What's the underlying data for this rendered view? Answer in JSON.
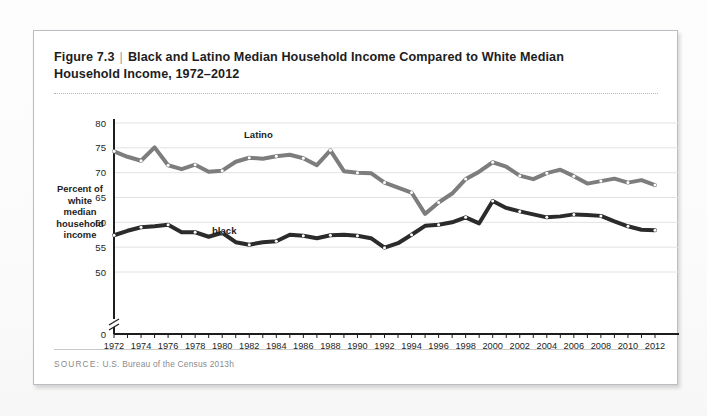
{
  "figure": {
    "number": "Figure 7.3",
    "separator": "|",
    "title_line1": "Black and Latino Median Household Income Compared to White Median",
    "title_line2": "Household Income, 1972–2012"
  },
  "source": {
    "label": "SOURCE:",
    "text": "U.S. Bureau of the Census 2013h"
  },
  "chart_data": {
    "type": "line",
    "title": "Black and Latino Median Household Income Compared to White Median Household Income, 1972–2012",
    "xlabel": "",
    "ylabel": "Percent of white median household income",
    "ylabel_lines": [
      "Percent of",
      "white",
      "median",
      "household",
      "income"
    ],
    "ylim": [
      45,
      80
    ],
    "yticks": [
      0,
      50,
      55,
      60,
      65,
      70,
      75,
      80
    ],
    "ytick_labels": [
      "0",
      "50",
      "55",
      "60",
      "65",
      "70",
      "75",
      "80"
    ],
    "axis_break": true,
    "grid": true,
    "grid_axis": "y",
    "legend": "inline-annotations",
    "x": [
      1972,
      1973,
      1974,
      1975,
      1976,
      1977,
      1978,
      1979,
      1980,
      1981,
      1982,
      1983,
      1984,
      1985,
      1986,
      1987,
      1988,
      1989,
      1990,
      1991,
      1992,
      1993,
      1994,
      1995,
      1996,
      1997,
      1998,
      1999,
      2000,
      2001,
      2002,
      2003,
      2004,
      2005,
      2006,
      2007,
      2008,
      2009,
      2010,
      2011,
      2012
    ],
    "xtick_labels": [
      "1972",
      "1974",
      "1976",
      "1978",
      "1980",
      "1982",
      "1984",
      "1986",
      "1988",
      "1990",
      "1992",
      "1994",
      "1996",
      "1998",
      "2000",
      "2002",
      "2004",
      "2006",
      "2008",
      "2010",
      "2012"
    ],
    "xtick_step": 2,
    "series": [
      {
        "name": "Latino",
        "color": "#7d7d7d",
        "values": [
          74.3,
          73.2,
          72.4,
          75.1,
          71.5,
          70.7,
          71.6,
          70.2,
          70.4,
          72.2,
          73.0,
          72.8,
          73.3,
          73.6,
          72.9,
          71.5,
          74.5,
          70.3,
          70.0,
          69.9,
          68.0,
          67.0,
          66.0,
          61.7,
          64.0,
          65.8,
          68.7,
          70.2,
          72.1,
          71.2,
          69.4,
          68.7,
          69.9,
          70.6,
          69.3,
          67.8,
          68.3,
          68.8,
          68.0,
          68.5,
          67.5
        ]
      },
      {
        "name": "black",
        "color": "#2b2b2b",
        "values": [
          57.4,
          58.3,
          59.0,
          59.2,
          59.5,
          58.0,
          58.0,
          57.1,
          57.9,
          56.0,
          55.5,
          56.0,
          56.2,
          57.5,
          57.3,
          56.8,
          57.4,
          57.5,
          57.3,
          56.8,
          54.9,
          55.8,
          57.5,
          59.3,
          59.5,
          60.0,
          61.0,
          59.8,
          64.3,
          62.9,
          62.2,
          61.6,
          61.0,
          61.2,
          61.6,
          61.5,
          61.3,
          60.2,
          59.2,
          58.5,
          58.4
        ]
      }
    ]
  }
}
